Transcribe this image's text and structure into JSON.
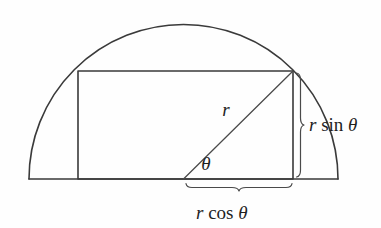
{
  "figure": {
    "background_color": "#fefefe",
    "line_color": "#3a3a3a",
    "text_color": "#1f1f1f"
  },
  "geometry": {
    "baseline_y": 179,
    "baseline_x_start": 29,
    "baseline_x_end": 338,
    "circle_center_x": 183.5,
    "circle_center_y": 179,
    "radius": 154.5,
    "rect_left": 78,
    "rect_top": 71,
    "rect_right": 293,
    "rect_bottom": 179,
    "vertex_x": 293,
    "vertex_y": 71,
    "angle_degrees": 44.6
  },
  "labels": {
    "radius": {
      "text": "r",
      "x": 226,
      "y": 116
    },
    "angle": {
      "text": "θ",
      "x": 206,
      "y": 170
    },
    "vertical_leg": {
      "var": "r",
      "func": "sin",
      "angle": "θ",
      "full": "r sin θ",
      "x": 309,
      "y": 131
    },
    "horizontal_leg": {
      "var": "r",
      "func": "cos",
      "angle": "θ",
      "full": "r cos θ",
      "x": 196,
      "y": 219
    }
  },
  "braces": {
    "vertical": {
      "name": "r-sin-theta-brace",
      "x": 300,
      "y_top": 71,
      "y_bottom": 179,
      "tip_y": 125
    },
    "horizontal": {
      "name": "r-cos-theta-brace",
      "y": 187,
      "x_left": 186,
      "x_right": 292,
      "tip_x": 239
    }
  }
}
